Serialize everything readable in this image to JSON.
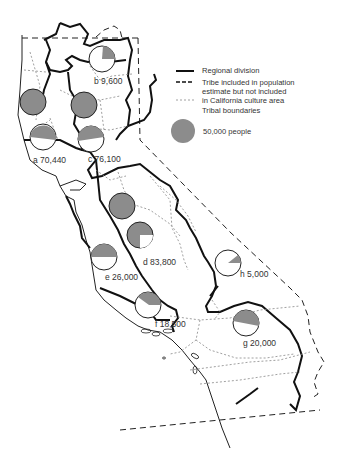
{
  "legend": {
    "regional_division": "Regional division",
    "tribe_included": "Tribe included in population estimate but not included in California culture area",
    "tribe_included_lines": [
      "Tribe included in population",
      "estimate but not included",
      "in California culture area"
    ],
    "tribal_boundaries": "Tribal boundaries",
    "scale_circle": "50,000 people"
  },
  "colors": {
    "fill": "#8c8c8c",
    "line": "#222222",
    "dotted": "#888888",
    "background": "#ffffff"
  },
  "regions": [
    {
      "letter": "a",
      "population": "70,440",
      "label": "a 70,440"
    },
    {
      "letter": "b",
      "population": "9,600",
      "label": "b 9,600"
    },
    {
      "letter": "c",
      "population": "76,100",
      "label": "c 76,100"
    },
    {
      "letter": "d",
      "population": "83,800",
      "label": "d 83,800"
    },
    {
      "letter": "e",
      "population": "26,000",
      "label": "e 26,000"
    },
    {
      "letter": "f",
      "population": "18,500",
      "label": "f 18,500"
    },
    {
      "letter": "g",
      "population": "20,000",
      "label": "g 20,000"
    },
    {
      "letter": "h",
      "population": "5,000",
      "label": "h 5,000"
    }
  ]
}
